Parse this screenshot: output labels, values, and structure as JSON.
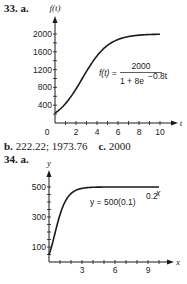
{
  "problem33": {
    "label": "33. a.",
    "answers": {
      "b_label": "b.",
      "b_value": "222.22; 1973.76",
      "c_label": "c.",
      "c_value": "2000"
    }
  },
  "problem34": {
    "label": "34. a."
  },
  "chart_data": [
    {
      "type": "line",
      "title": "",
      "xlabel": "t",
      "ylabel": "f(t)",
      "equation": "f(t) = 2000 / (1 + 8e^(-0.8t))",
      "equation_lhs": "f(t) =",
      "equation_num": "2000",
      "equation_den": "1 + 8e",
      "equation_exp": "−0.8t",
      "xlim": [
        0,
        10
      ],
      "ylim": [
        0,
        2000
      ],
      "x_ticks": [
        "0",
        "2",
        "4",
        "6",
        "8",
        "10"
      ],
      "y_ticks": [
        "400",
        "800",
        "1200",
        "1600",
        "2000"
      ],
      "grid": false,
      "series": [
        {
          "name": "f(t)",
          "x": [
            0,
            1,
            2,
            3,
            4,
            5,
            6,
            7,
            8,
            9,
            10
          ],
          "values": [
            222.2,
            435.7,
            764.8,
            1170.6,
            1508.1,
            1735.4,
            1876.5,
            1946.5,
            1973.8,
            1988.9,
            1994.6
          ]
        }
      ]
    },
    {
      "type": "line",
      "title": "",
      "xlabel": "x",
      "ylabel": "y",
      "equation": "y = 500(0.1)^(0.2^x)",
      "equation_lhs": "y = 500(0.1)",
      "equation_exp": "0.2",
      "equation_exp2": "x",
      "xlim": [
        0,
        10
      ],
      "ylim": [
        0,
        500
      ],
      "x_ticks": [
        "3",
        "6",
        "9"
      ],
      "y_ticks": [
        "100",
        "300",
        "500"
      ],
      "grid": false,
      "series": [
        {
          "name": "y",
          "x": [
            0,
            0.5,
            1,
            1.5,
            2,
            2.5,
            3,
            4,
            5,
            6,
            8,
            10
          ],
          "values": [
            50,
            179.4,
            315.5,
            405.7,
            456.1,
            481.3,
            491.0,
            498.2,
            499.6,
            499.9,
            500,
            500
          ]
        }
      ]
    }
  ]
}
